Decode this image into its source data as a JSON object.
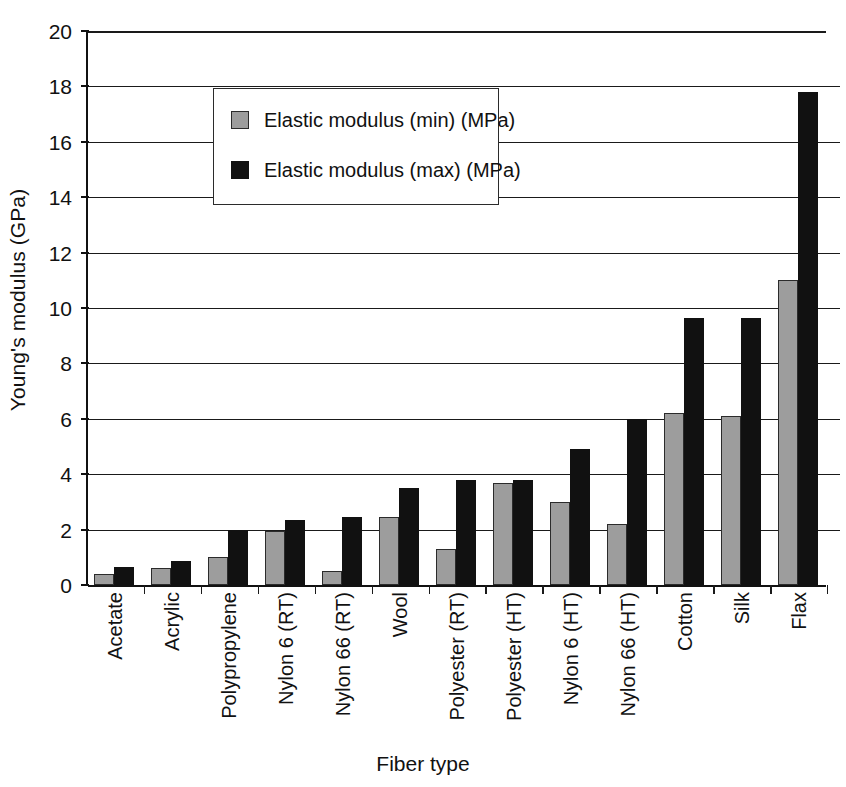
{
  "chart_data": {
    "type": "bar",
    "title": "",
    "xlabel": "Fiber type",
    "ylabel": "Young's modulus (GPa)",
    "ylim": [
      0,
      20
    ],
    "ytick_step": 2,
    "yticks": [
      0,
      2,
      4,
      6,
      8,
      10,
      12,
      14,
      16,
      18,
      20
    ],
    "ytick_labels": [
      "0",
      "2",
      "4",
      "6",
      "8",
      "10",
      "12",
      "14",
      "16",
      "18",
      "20"
    ],
    "grid": true,
    "legend_position": "upper-left-inside",
    "categories": [
      "Acetate",
      "Acrylic",
      "Polypropylene",
      "Nylon 6 (RT)",
      "Nylon 66 (RT)",
      "Wool",
      "Polyester (RT)",
      "Polyester (HT)",
      "Nylon 6 (HT)",
      "Nylon 66 (HT)",
      "Cotton",
      "Silk",
      "Flax"
    ],
    "series": [
      {
        "name": "Elastic modulus (min) (MPa)",
        "color": "#9d9d9d",
        "values": [
          0.4,
          0.6,
          1.0,
          1.95,
          0.5,
          2.45,
          1.3,
          3.7,
          3.0,
          2.2,
          6.2,
          6.1,
          11.0
        ]
      },
      {
        "name": "Elastic modulus (max) (MPa)",
        "color": "#111111",
        "values": [
          0.65,
          0.85,
          2.0,
          2.35,
          2.45,
          3.5,
          3.8,
          3.8,
          4.9,
          6.0,
          9.65,
          9.65,
          17.8
        ]
      }
    ]
  },
  "legend": {
    "items": [
      {
        "label": "Elastic modulus (min) (MPa)",
        "swatch": "min"
      },
      {
        "label": "Elastic modulus (max) (MPa)",
        "swatch": "max"
      }
    ]
  },
  "axes": {
    "y_title": "Young's modulus (GPa)",
    "x_title": "Fiber type"
  },
  "colors": {
    "series_min": "#9d9d9d",
    "series_max": "#111111",
    "axis": "#111111",
    "grid": "#1a1a1a",
    "background": "#ffffff"
  }
}
